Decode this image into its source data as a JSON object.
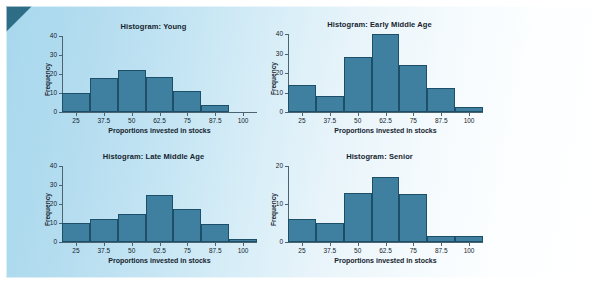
{
  "figure": {
    "top_cut_text": "",
    "panel_bg_left": "#a8d8ee",
    "panel_bg_right": "#ffffff",
    "corner_color": "#2d6e86",
    "bar_fill": "#3f7f9f",
    "bar_stroke": "#1d4f69",
    "axis_color": "#4a6472"
  },
  "chart_data": [
    {
      "id": "young",
      "type": "bar",
      "title": "Histogram: Young",
      "xlabel": "Proportions invested in stocks",
      "ylabel": "Frequency",
      "categories": [
        "25",
        "37.5",
        "50",
        "62.5",
        "75",
        "87.5",
        "100"
      ],
      "bin_centers": [
        25,
        37.5,
        50,
        62.5,
        75,
        87.5,
        100
      ],
      "values": [
        10,
        18,
        22,
        18.5,
        11,
        3.5,
        0
      ],
      "xlim": [
        18.75,
        106.25
      ],
      "ylim": [
        0,
        40
      ],
      "yticks": [
        0,
        10,
        20,
        30,
        40
      ],
      "grid": false,
      "legend": "none"
    },
    {
      "id": "early-middle-age",
      "type": "bar",
      "title": "Histogram: Early Middle Age",
      "xlabel": "Proportions invested in stocks",
      "ylabel": "Frequency",
      "categories": [
        "25",
        "37.5",
        "50",
        "62.5",
        "75",
        "87.5",
        "100"
      ],
      "bin_centers": [
        25,
        37.5,
        50,
        62.5,
        75,
        87.5,
        100
      ],
      "values": [
        14,
        8,
        28,
        40,
        24,
        12.5,
        2.5
      ],
      "xlim": [
        18.75,
        106.25
      ],
      "ylim": [
        0,
        40
      ],
      "yticks": [
        0,
        10,
        20,
        30,
        40
      ],
      "grid": false,
      "legend": "none"
    },
    {
      "id": "late-middle-age",
      "type": "bar",
      "title": "Histogram: Late Middle Age",
      "xlabel": "Proportions invested in stocks",
      "ylabel": "Frequency",
      "categories": [
        "25",
        "37.5",
        "50",
        "62.5",
        "75",
        "87.5",
        "100"
      ],
      "bin_centers": [
        25,
        37.5,
        50,
        62.5,
        75,
        87.5,
        100
      ],
      "values": [
        10,
        12,
        14.5,
        25,
        17.5,
        9.5,
        1.5
      ],
      "xlim": [
        18.75,
        106.25
      ],
      "ylim": [
        0,
        40
      ],
      "yticks": [
        0,
        10,
        20,
        30,
        40
      ],
      "grid": false,
      "legend": "none"
    },
    {
      "id": "senior",
      "type": "bar",
      "title": "Histogram: Senior",
      "xlabel": "Proportions invested in stocks",
      "ylabel": "Frequency",
      "categories": [
        "25",
        "37.5",
        "50",
        "62.5",
        "75",
        "87.5",
        "100"
      ],
      "bin_centers": [
        25,
        37.5,
        50,
        62.5,
        75,
        87.5,
        100
      ],
      "values": [
        6,
        5,
        13,
        17,
        12.7,
        1.5,
        1.5
      ],
      "xlim": [
        18.75,
        106.25
      ],
      "ylim": [
        0,
        20
      ],
      "yticks": [
        0,
        10,
        20
      ],
      "grid": false,
      "legend": "none"
    }
  ],
  "layout": {
    "charts": [
      {
        "left": 30,
        "top": 16,
        "width": 235,
        "height": 120
      },
      {
        "left": 256,
        "top": 14,
        "width": 235,
        "height": 122
      },
      {
        "left": 30,
        "top": 146,
        "width": 235,
        "height": 120
      },
      {
        "left": 256,
        "top": 146,
        "width": 235,
        "height": 120
      }
    ]
  }
}
